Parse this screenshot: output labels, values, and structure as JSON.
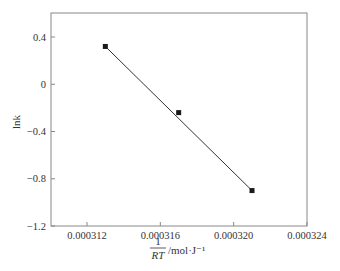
{
  "chart_data": {
    "type": "scatter",
    "title": "",
    "xlabel_numerator": "1",
    "xlabel_denominator": "RT",
    "xlabel_units": "/mol·J⁻¹",
    "xlabel": "1/RT /mol·J⁻¹",
    "ylabel": "lnk",
    "xlim": [
      0.00031,
      0.000324
    ],
    "ylim": [
      -1.2,
      0.6
    ],
    "xticks": [
      0.000312,
      0.000316,
      0.00032,
      0.000324
    ],
    "xtick_labels": [
      "0.000312",
      "0.000316",
      "0.000320",
      "0.000324"
    ],
    "yticks": [
      0.4,
      0,
      -0.4,
      -0.8,
      -1.2
    ],
    "ytick_labels": [
      "0.4",
      "0",
      "−0.4",
      "−0.8",
      "−1.2"
    ],
    "grid": false,
    "legend": null,
    "series": [
      {
        "name": "lnk data",
        "marker": "square",
        "color": "#1a1a1a",
        "x": [
          0.000313,
          0.000317,
          0.000321
        ],
        "y": [
          0.32,
          -0.24,
          -0.9
        ]
      },
      {
        "name": "linear fit",
        "style": "line",
        "color": "#333333",
        "x": [
          0.000313,
          0.000321
        ],
        "y": [
          0.32,
          -0.9
        ]
      }
    ]
  }
}
